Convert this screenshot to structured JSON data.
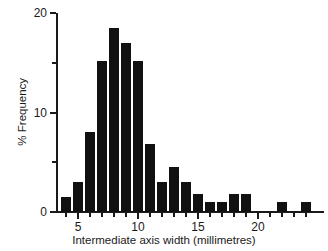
{
  "chart_data": {
    "type": "bar",
    "title": "",
    "subtitle": "",
    "xlabel": "Intermediate axis width (millimetres)",
    "ylabel": "% Frequency",
    "xlim": [
      3.5,
      24.5
    ],
    "ylim": [
      0,
      20
    ],
    "grid": false,
    "legend": null,
    "bin_width": 1,
    "x_tick_labels": [
      "5",
      "10",
      "15",
      "20"
    ],
    "x_tick_values": [
      5,
      10,
      15,
      20
    ],
    "x_minor_tick_values": [
      4,
      6,
      7,
      8,
      9,
      11,
      12,
      13,
      14,
      16,
      17,
      18,
      19,
      21,
      22,
      23,
      24
    ],
    "y_tick_labels": [
      "0",
      "10",
      "20"
    ],
    "y_tick_values": [
      0,
      10,
      20
    ],
    "y_minor_tick_values": [
      5,
      15
    ],
    "bar_color": "#111111",
    "axis_color": "#1a1a1a",
    "categories": [
      4,
      5,
      6,
      7,
      8,
      9,
      10,
      11,
      12,
      13,
      14,
      15,
      16,
      17,
      18,
      19,
      20,
      21,
      22,
      23,
      24
    ],
    "values": [
      1.5,
      3.0,
      8.0,
      15.2,
      18.5,
      17.0,
      15.2,
      6.8,
      3.0,
      4.5,
      3.0,
      1.8,
      1.0,
      1.0,
      1.8,
      1.8,
      0,
      0,
      1.0,
      0,
      1.0
    ]
  }
}
